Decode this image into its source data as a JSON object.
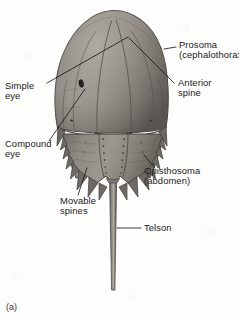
{
  "figure": {
    "caption": "(a)",
    "view": "dorsal",
    "width": 239,
    "height": 314,
    "background_color": "#fdfdfc",
    "ink_color": "#1b1b1b",
    "carapace_color": "#8e8a84"
  },
  "labels": {
    "prosoma": {
      "line1": "Prosoma",
      "line2": "(cephalothorax)"
    },
    "anterior_spine": {
      "line1": "Anterior",
      "line2": "spine"
    },
    "simple_eye": {
      "line1": "Simple",
      "line2": "eye"
    },
    "compound_eye": {
      "line1": "Compound",
      "line2": "eye"
    },
    "movable_spines": {
      "line1": "Movable",
      "line2": "spines"
    },
    "opisthosoma": {
      "line1": "Opisthosoma",
      "line2": "(abdomen)"
    },
    "telson": {
      "line1": "Telson"
    }
  }
}
